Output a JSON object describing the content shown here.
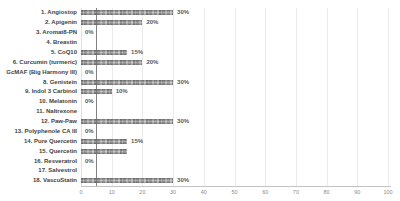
{
  "chart_data": {
    "type": "bar",
    "orientation": "horizontal",
    "title_text_mostly_cut_off": "Illustrates % of total cancer cell death achieved via PI3K and nutritional pathways",
    "categories": [
      "1. Angiostop",
      "2. Apigenin",
      "3. Aromat8-PN",
      "4. Breastin",
      "5. CoQ10",
      "6. Curcumin (turmeric)",
      "GcMAF (Big Harmony III)",
      "8. Genistein",
      "9. Indol 3 Carbinol",
      "10. Melatonin",
      "11. Naltrexone",
      "12. Paw-Paw",
      "13. Polyphenole CA III",
      "14. Pure Quercetin",
      "15. Quercetin",
      "16. Resveratrol",
      "17. Salvestrol",
      "18. VascuStatin"
    ],
    "values": [
      30,
      20,
      0,
      null,
      15,
      20,
      0,
      30,
      10,
      0,
      null,
      30,
      0,
      15,
      15,
      0,
      null,
      30
    ],
    "value_labels": [
      "30%",
      "20%",
      "0%",
      "",
      "15%",
      "20%",
      "0%",
      "30%",
      "10%",
      "0%",
      "",
      "30%",
      "0%",
      "15%",
      "",
      "0%",
      "",
      "30%"
    ],
    "xlabel": "",
    "ylabel": "",
    "xlim": [
      0,
      100
    ],
    "x_ticks": [
      0,
      10,
      20,
      30,
      40,
      50,
      60,
      70,
      80,
      90,
      100
    ],
    "reference_line_x": 5,
    "grid": "vertical-major-gridlines",
    "legend": "none"
  },
  "colors": {
    "background": "#ffffff",
    "bar_fill_base": "#9a9a9a",
    "bar_fill_dark": "#7f7f7f",
    "bar_fill_light": "#c0c0c0",
    "category_label": "#3f3f3f",
    "value_label": "#595959",
    "tick_label": "#8c8c8c",
    "gridline": "#ebebeb",
    "axis_line": "#c3c3c3",
    "reference_line": "#6b6b6b",
    "title": "#8f8f8f"
  }
}
